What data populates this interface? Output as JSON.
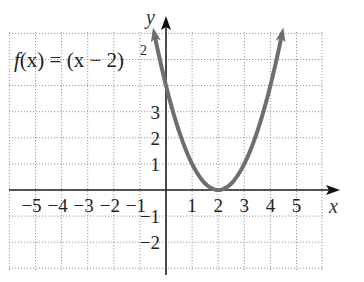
{
  "chart_data": {
    "type": "line",
    "function": "(x-2)^2",
    "xlabel": "x",
    "ylabel": "y",
    "xlim": [
      -6,
      6
    ],
    "ylim": [
      -3,
      6
    ],
    "grid": true,
    "grid_style": "dotted",
    "x_ticks": [
      -5,
      -4,
      -3,
      -2,
      -1,
      1,
      2,
      3,
      4,
      5
    ],
    "y_ticks": [
      -2,
      -1,
      1,
      2,
      3
    ],
    "x_tick_labels": [
      "−5",
      "−4",
      "−3",
      "−2",
      "−1",
      "1",
      "2",
      "3",
      "4",
      "5"
    ],
    "y_tick_labels": [
      "−2",
      "−1",
      "1",
      "2",
      "3"
    ],
    "series": [
      {
        "name": "f(x) = (x − 2)²",
        "x": [
          -0.45,
          0,
          0.5,
          1,
          1.5,
          2,
          2.5,
          3,
          3.5,
          4,
          4.45
        ],
        "y": [
          6.0,
          4,
          2.25,
          1,
          0.25,
          0,
          0.25,
          1,
          2.25,
          4,
          6.0
        ],
        "color": "#6e6e6e",
        "arrows": "both-ends"
      }
    ],
    "vertex": [
      2,
      0
    ],
    "y_intercept": [
      0,
      4
    ]
  },
  "labels": {
    "function_label_prefix": "f(x) = (x − 2)",
    "function_label_exp": "2",
    "x_axis": "x",
    "y_axis": "y"
  },
  "colors": {
    "curve": "#6e6e6e",
    "axis": "#222222",
    "grid": "#9a9a9a",
    "text": "#222222"
  }
}
